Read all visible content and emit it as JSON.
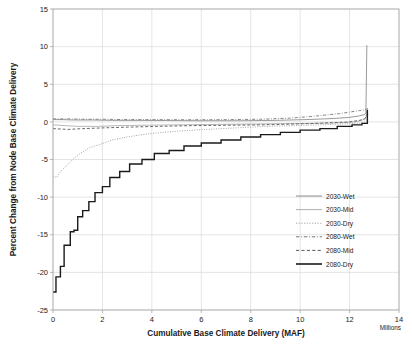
{
  "chart_data": {
    "type": "line",
    "title": "",
    "xlabel": "Cumulative Base Climate Delivery (MAF)",
    "ylabel": "Percent Change from Node Base Climate Delivery",
    "x_units_note": "Millions",
    "xlim": [
      0,
      14
    ],
    "ylim": [
      -25,
      15
    ],
    "xticks": [
      0,
      2,
      4,
      6,
      8,
      10,
      12,
      14
    ],
    "xtick_labels": [
      "0",
      "2",
      "4",
      "6",
      "8",
      "10",
      "12",
      "14"
    ],
    "yticks": [
      -25,
      -20,
      -15,
      -10,
      -5,
      0,
      5,
      10,
      15
    ],
    "ytick_labels": [
      "-25",
      "-20",
      "-15",
      "-10",
      "-5",
      "0",
      "5",
      "10",
      "15"
    ],
    "grid": true,
    "legend_position": "inside-bottom-right",
    "series": [
      {
        "name": "2030-Wet",
        "color": "#808080",
        "dash": "none",
        "width": 0.8,
        "points": [
          [
            0,
            0.3
          ],
          [
            0.4,
            0.3
          ],
          [
            0.8,
            0.25
          ],
          [
            1.6,
            0.25
          ],
          [
            2.4,
            0.2
          ],
          [
            3.4,
            0.2
          ],
          [
            4.6,
            0.18
          ],
          [
            6.0,
            0.15
          ],
          [
            7.6,
            0.15
          ],
          [
            9.0,
            0.2
          ],
          [
            10.2,
            0.3
          ],
          [
            11.0,
            0.4
          ],
          [
            11.6,
            0.5
          ],
          [
            12.0,
            0.6
          ],
          [
            12.4,
            0.8
          ],
          [
            12.62,
            1.0
          ],
          [
            12.66,
            1.2
          ],
          [
            12.7,
            10.2
          ]
        ]
      },
      {
        "name": "2030-Mid",
        "color": "#a6a6a6",
        "dash": "none",
        "width": 0.8,
        "points": [
          [
            0,
            -0.4
          ],
          [
            0.5,
            -0.5
          ],
          [
            1.0,
            -0.6
          ],
          [
            1.8,
            -0.6
          ],
          [
            2.6,
            -0.5
          ],
          [
            3.6,
            -0.45
          ],
          [
            4.8,
            -0.4
          ],
          [
            6.2,
            -0.35
          ],
          [
            7.6,
            -0.3
          ],
          [
            9.0,
            -0.25
          ],
          [
            10.4,
            -0.2
          ],
          [
            11.2,
            -0.15
          ],
          [
            11.8,
            -0.1
          ],
          [
            12.2,
            0.0
          ],
          [
            12.5,
            0.2
          ],
          [
            12.64,
            0.5
          ],
          [
            12.68,
            0.8
          ],
          [
            12.72,
            1.6
          ]
        ]
      },
      {
        "name": "2030-Dry",
        "color": "#9b9b9b",
        "dash": "dotted",
        "width": 0.9,
        "points": [
          [
            0,
            -7.2
          ],
          [
            0.15,
            -7.4
          ],
          [
            0.3,
            -6.6
          ],
          [
            0.5,
            -6.0
          ],
          [
            0.8,
            -5.0
          ],
          [
            1.1,
            -4.2
          ],
          [
            1.5,
            -3.4
          ],
          [
            1.9,
            -3.0
          ],
          [
            2.4,
            -2.4
          ],
          [
            3.0,
            -2.0
          ],
          [
            3.6,
            -1.7
          ],
          [
            4.4,
            -1.4
          ],
          [
            5.2,
            -1.2
          ],
          [
            6.2,
            -1.0
          ],
          [
            7.4,
            -0.8
          ],
          [
            8.6,
            -0.6
          ],
          [
            9.8,
            -0.5
          ],
          [
            10.8,
            -0.4
          ],
          [
            11.6,
            -0.3
          ],
          [
            12.2,
            -0.2
          ],
          [
            12.6,
            -0.1
          ],
          [
            12.72,
            1.5
          ]
        ]
      },
      {
        "name": "2080-Wet",
        "color": "#777777",
        "dash": "dashdot",
        "width": 0.9,
        "points": [
          [
            0,
            0.4
          ],
          [
            0.6,
            0.4
          ],
          [
            1.2,
            0.35
          ],
          [
            2.0,
            0.35
          ],
          [
            3.0,
            0.3
          ],
          [
            4.2,
            0.3
          ],
          [
            5.6,
            0.28
          ],
          [
            7.0,
            0.3
          ],
          [
            8.4,
            0.35
          ],
          [
            9.6,
            0.5
          ],
          [
            10.4,
            0.7
          ],
          [
            11.0,
            0.9
          ],
          [
            11.6,
            1.1
          ],
          [
            12.0,
            1.3
          ],
          [
            12.4,
            1.5
          ],
          [
            12.6,
            1.6
          ],
          [
            12.7,
            1.7
          ],
          [
            12.74,
            1.8
          ]
        ]
      },
      {
        "name": "2080-Mid",
        "color": "#595959",
        "dash": "dashed",
        "width": 0.9,
        "points": [
          [
            0,
            -0.9
          ],
          [
            0.6,
            -1.0
          ],
          [
            1.2,
            -0.9
          ],
          [
            2.0,
            -0.8
          ],
          [
            3.0,
            -0.7
          ],
          [
            4.2,
            -0.6
          ],
          [
            5.6,
            -0.5
          ],
          [
            7.0,
            -0.45
          ],
          [
            8.4,
            -0.4
          ],
          [
            9.6,
            -0.3
          ],
          [
            10.6,
            -0.2
          ],
          [
            11.4,
            -0.1
          ],
          [
            12.0,
            0.0
          ],
          [
            12.4,
            0.2
          ],
          [
            12.6,
            0.4
          ],
          [
            12.7,
            0.7
          ],
          [
            12.74,
            1.0
          ]
        ]
      },
      {
        "name": "2080-Dry",
        "color": "#1a1a1a",
        "dash": "none",
        "width": 1.4,
        "points": [
          [
            0,
            -22.6
          ],
          [
            0.12,
            -22.6
          ],
          [
            0.12,
            -20.6
          ],
          [
            0.3,
            -20.6
          ],
          [
            0.3,
            -19.2
          ],
          [
            0.45,
            -19.2
          ],
          [
            0.45,
            -16.4
          ],
          [
            0.7,
            -16.4
          ],
          [
            0.7,
            -14.6
          ],
          [
            0.85,
            -14.6
          ],
          [
            0.85,
            -14.4
          ],
          [
            1.0,
            -14.4
          ],
          [
            1.0,
            -12.6
          ],
          [
            1.2,
            -12.6
          ],
          [
            1.2,
            -11.8
          ],
          [
            1.45,
            -11.8
          ],
          [
            1.45,
            -10.6
          ],
          [
            1.7,
            -10.6
          ],
          [
            1.7,
            -9.4
          ],
          [
            2.0,
            -9.4
          ],
          [
            2.0,
            -8.6
          ],
          [
            2.3,
            -8.6
          ],
          [
            2.3,
            -7.4
          ],
          [
            2.7,
            -7.4
          ],
          [
            2.7,
            -6.6
          ],
          [
            3.1,
            -6.6
          ],
          [
            3.1,
            -5.6
          ],
          [
            3.6,
            -5.6
          ],
          [
            3.6,
            -5.0
          ],
          [
            4.1,
            -5.0
          ],
          [
            4.1,
            -4.2
          ],
          [
            4.7,
            -4.2
          ],
          [
            4.7,
            -3.8
          ],
          [
            5.3,
            -3.8
          ],
          [
            5.3,
            -3.2
          ],
          [
            6.0,
            -3.2
          ],
          [
            6.0,
            -2.8
          ],
          [
            6.8,
            -2.8
          ],
          [
            6.8,
            -2.4
          ],
          [
            7.6,
            -2.4
          ],
          [
            7.6,
            -2.0
          ],
          [
            8.4,
            -2.0
          ],
          [
            8.4,
            -1.7
          ],
          [
            9.2,
            -1.7
          ],
          [
            9.2,
            -1.4
          ],
          [
            10.0,
            -1.4
          ],
          [
            10.0,
            -1.1
          ],
          [
            10.8,
            -1.1
          ],
          [
            10.8,
            -0.9
          ],
          [
            11.5,
            -0.9
          ],
          [
            11.5,
            -0.6
          ],
          [
            12.1,
            -0.6
          ],
          [
            12.1,
            -0.4
          ],
          [
            12.5,
            -0.4
          ],
          [
            12.5,
            -0.2
          ],
          [
            12.72,
            -0.2
          ],
          [
            12.72,
            1.6
          ]
        ]
      }
    ],
    "legend": [
      {
        "label": "2030-Wet",
        "color": "#808080",
        "dash": "none",
        "width": 0.9
      },
      {
        "label": "2030-Mid",
        "color": "#a6a6a6",
        "dash": "none",
        "width": 0.9
      },
      {
        "label": "2030-Dry",
        "color": "#9b9b9b",
        "dash": "dotted",
        "width": 1.0
      },
      {
        "label": "2080-Wet",
        "color": "#777777",
        "dash": "dashdot",
        "width": 1.0
      },
      {
        "label": "2080-Mid",
        "color": "#595959",
        "dash": "dashed",
        "width": 1.0
      },
      {
        "label": "2080-Dry",
        "color": "#1a1a1a",
        "dash": "none",
        "width": 1.6
      }
    ]
  }
}
